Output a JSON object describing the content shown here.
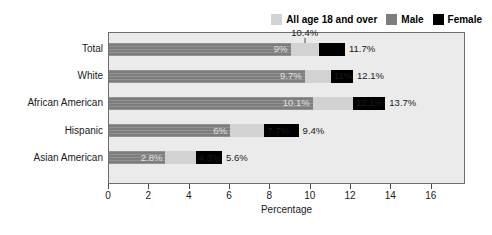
{
  "chart_data": {
    "type": "bar",
    "orientation": "horizontal",
    "title": "",
    "xlabel": "Percentage",
    "ylabel": "",
    "xlim": [
      0,
      17.6
    ],
    "xticks": [
      0,
      2,
      4,
      6,
      8,
      10,
      12,
      14,
      16
    ],
    "xtick_labels": [
      "0",
      "2",
      "4",
      "6",
      "8",
      "10",
      "12",
      "14",
      "16"
    ],
    "grid": false,
    "legend_position": "top-right",
    "categories": [
      "Total",
      "White",
      "African American",
      "Hispanic",
      "Asian American"
    ],
    "series": [
      {
        "name": "All age 18 and over",
        "color": "#d2d2d2",
        "values": [
          10.4,
          11,
          12.1,
          7.7,
          4.3
        ],
        "value_labels": [
          "10.4%",
          "11%",
          "12.1%",
          "7.7%",
          "4.3%"
        ]
      },
      {
        "name": "Male",
        "color": "#7d7d7d",
        "values": [
          9,
          9.7,
          10.1,
          6,
          2.8
        ],
        "value_labels": [
          "9%",
          "9.7%",
          "10.1%",
          "6%",
          "2.8%"
        ]
      },
      {
        "name": "Female",
        "color": "#000000",
        "values": [
          11.7,
          12.1,
          13.7,
          9.4,
          5.6
        ],
        "value_labels": [
          "11.7%",
          "12.1%",
          "13.7%",
          "9.4%",
          "5.6%"
        ]
      }
    ],
    "annotations": [
      {
        "text": "10.4%",
        "series": "All age 18 and over",
        "category": "Total",
        "style": "callout-above-with-leader-line"
      }
    ]
  },
  "legend": {
    "items": [
      {
        "label": "All age 18 and over",
        "color": "#d2d2d2"
      },
      {
        "label": "Male",
        "color": "#7d7d7d"
      },
      {
        "label": "Female",
        "color": "#000000"
      }
    ]
  },
  "axis": {
    "x_title": "Percentage",
    "x_ticks": [
      "0",
      "2",
      "4",
      "6",
      "8",
      "10",
      "12",
      "14",
      "16"
    ]
  },
  "rows": [
    {
      "category": "Total",
      "male_label": "9%",
      "all_label": "10.4%",
      "female_label": "11.7%",
      "male": 9,
      "all": 10.4,
      "female": 11.7,
      "all_label_mode": "callout"
    },
    {
      "category": "White",
      "male_label": "9.7%",
      "all_label": "11%",
      "female_label": "12.1%",
      "male": 9.7,
      "all": 11,
      "female": 12.1,
      "all_label_mode": "inline"
    },
    {
      "category": "African American",
      "male_label": "10.1%",
      "all_label": "12.1%",
      "female_label": "13.7%",
      "male": 10.1,
      "all": 12.1,
      "female": 13.7,
      "all_label_mode": "inline"
    },
    {
      "category": "Hispanic",
      "male_label": "6%",
      "all_label": "7.7%",
      "female_label": "9.4%",
      "male": 6,
      "all": 7.7,
      "female": 9.4,
      "all_label_mode": "inline"
    },
    {
      "category": "Asian American",
      "male_label": "2.8%",
      "all_label": "4.3%",
      "female_label": "5.6%",
      "male": 2.8,
      "all": 4.3,
      "female": 5.6,
      "all_label_mode": "inline"
    }
  ]
}
